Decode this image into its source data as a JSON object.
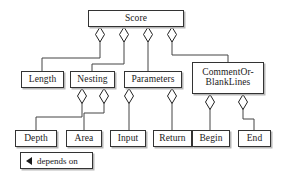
{
  "diagram": {
    "title": "Score",
    "type": "uml-aggregation-hierarchy",
    "canvas": {
      "width": 282,
      "height": 177
    },
    "style": {
      "box_fill": "#ffffff",
      "box_border": "#333333",
      "box_shadow": "#b8b8b8",
      "edge_color": "#444444",
      "text_color": "#1a1a1a",
      "background": "#ffffff"
    },
    "nodes": [
      {
        "id": "score",
        "label": "Score",
        "x": 88,
        "y": 10,
        "w": 96,
        "h": 17,
        "font_size": 9.5,
        "level": 0
      },
      {
        "id": "length",
        "label": "Length",
        "x": 21,
        "y": 71,
        "w": 43,
        "h": 17,
        "font_size": 9.5,
        "level": 1
      },
      {
        "id": "nesting",
        "label": "Nesting",
        "x": 70,
        "y": 71,
        "w": 45,
        "h": 17,
        "font_size": 9.5,
        "level": 1
      },
      {
        "id": "parameters",
        "label": "Parameters",
        "x": 124,
        "y": 71,
        "w": 58,
        "h": 17,
        "font_size": 9.5,
        "level": 1
      },
      {
        "id": "comment-or-blank-lines",
        "label": "CommentOr-\nBlankLines",
        "x": 192,
        "y": 62,
        "w": 72,
        "h": 32,
        "font_size": 9.5,
        "level": 1
      },
      {
        "id": "depth",
        "label": "Depth",
        "x": 15,
        "y": 130,
        "w": 42,
        "h": 17,
        "font_size": 9.5,
        "level": 2
      },
      {
        "id": "area",
        "label": "Area",
        "x": 66,
        "y": 130,
        "w": 36,
        "h": 17,
        "font_size": 9.5,
        "level": 2
      },
      {
        "id": "input",
        "label": "Input",
        "x": 110,
        "y": 130,
        "w": 36,
        "h": 17,
        "font_size": 9.5,
        "level": 2
      },
      {
        "id": "return",
        "label": "Return",
        "x": 153,
        "y": 130,
        "w": 39,
        "h": 17,
        "font_size": 9.5,
        "level": 2
      },
      {
        "id": "begin",
        "label": "Begin",
        "x": 192,
        "y": 130,
        "w": 38,
        "h": 17,
        "font_size": 9.5,
        "level": 2
      },
      {
        "id": "end",
        "label": "End",
        "x": 238,
        "y": 130,
        "w": 33,
        "h": 17,
        "font_size": 9.5,
        "level": 2
      }
    ],
    "edges": [
      {
        "id": "score-length",
        "from": "score",
        "to": "length",
        "diamond": {
          "cx": 100,
          "cy": 34.5,
          "rx": 4.5,
          "ry": 7.5
        },
        "path": "M 100 27 L 100 42 M 100 42 L 100 58 L 42 58 L 42 71"
      },
      {
        "id": "score-nesting",
        "from": "score",
        "to": "nesting",
        "diamond": {
          "cx": 124,
          "cy": 34.5,
          "rx": 4.5,
          "ry": 7.5
        },
        "path": "M 124 27 L 124 42 M 124 42 L 124 64 L 92 64 L 92 71"
      },
      {
        "id": "score-parameters",
        "from": "score",
        "to": "parameters",
        "diamond": {
          "cx": 148,
          "cy": 34.5,
          "rx": 4.5,
          "ry": 7.5
        },
        "path": "M 148 27 L 148 42 M 148 42 L 148 71"
      },
      {
        "id": "score-commentorblanklines",
        "from": "score",
        "to": "comment-or-blank-lines",
        "diamond": {
          "cx": 172,
          "cy": 34.5,
          "rx": 4.5,
          "ry": 7.5
        },
        "path": "M 172 27 L 172 42 M 172 42 L 172 55 L 228 55 L 228 62"
      },
      {
        "id": "nesting-depth",
        "from": "nesting",
        "to": "depth",
        "diamond": {
          "cx": 82,
          "cy": 96,
          "rx": 4.5,
          "ry": 7.5
        },
        "path": "M 82 88 L 82 103.5 M 82 103.5 L 82 117 L 36 117 L 36 130"
      },
      {
        "id": "nesting-area",
        "from": "nesting",
        "to": "area",
        "diamond": {
          "cx": 104,
          "cy": 96,
          "rx": 4.5,
          "ry": 7.5
        },
        "path": "M 104 88 L 104 103.5 M 104 103.5 L 104 113 L 84 113 L 84 130"
      },
      {
        "id": "parameters-input",
        "from": "parameters",
        "to": "input",
        "diamond": {
          "cx": 129,
          "cy": 96,
          "rx": 4.5,
          "ry": 7.5
        },
        "path": "M 129 88 L 129 103.5 M 129 103.5 L 129 130"
      },
      {
        "id": "parameters-return",
        "from": "parameters",
        "to": "return",
        "diamond": {
          "cx": 172,
          "cy": 96,
          "rx": 4.5,
          "ry": 7.5
        },
        "path": "M 172 88 L 172 103.5 M 172 103.5 L 172 130"
      },
      {
        "id": "commentorblanklines-begin",
        "from": "comment-or-blank-lines",
        "to": "begin",
        "diamond": {
          "cx": 210,
          "cy": 102,
          "rx": 4.5,
          "ry": 7.5
        },
        "path": "M 210 94 L 210 109.5 M 210 109.5 L 210 130"
      },
      {
        "id": "commentorblanklines-end",
        "from": "comment-or-blank-lines",
        "to": "end",
        "diamond": {
          "cx": 243,
          "cy": 102,
          "rx": 4.5,
          "ry": 7.5
        },
        "path": "M 243 94 L 243 109.5 M 243 109.5 L 243 119 L 254 119 L 254 130"
      }
    ],
    "legend": {
      "id": "depends-on-legend",
      "arrow_icon": "left-triangle-icon",
      "text": "depends on",
      "x": 20,
      "y": 152,
      "w": 73,
      "h": 17,
      "font_size": 9
    }
  }
}
